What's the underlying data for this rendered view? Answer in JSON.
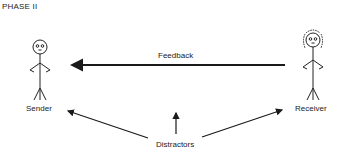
{
  "diagram": {
    "title": "PHASE II",
    "nodes": {
      "sender": {
        "label": "Sender"
      },
      "receiver": {
        "label": "Receiver"
      },
      "distractors": {
        "label": "Distractors"
      }
    },
    "edges": {
      "feedback": {
        "label": "Feedback",
        "from": "Receiver",
        "to": "Sender"
      }
    },
    "colors": {
      "line": "#1a1a1a",
      "text": "#222222"
    }
  }
}
